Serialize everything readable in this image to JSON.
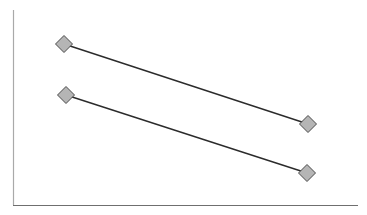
{
  "chart_data": {
    "type": "line",
    "title": "",
    "subtitle": "",
    "xlabel": "",
    "ylabel": "",
    "grid": false,
    "legend": false,
    "legend_position": "none",
    "annotations": [],
    "xtick_labels": [],
    "ytick_labels": [],
    "xlim": [
      0,
      367
    ],
    "ylim": [
      0,
      215
    ],
    "x": [
      64,
      308
    ],
    "series": [
      {
        "name": "Series 1",
        "values": [
          44,
          124
        ],
        "points": [
          {
            "x": 64,
            "y": 44
          },
          {
            "x": 308,
            "y": 124
          }
        ]
      },
      {
        "name": "Series 2",
        "values": [
          95,
          173
        ],
        "points": [
          {
            "x": 66,
            "y": 95
          },
          {
            "x": 307,
            "y": 173
          }
        ]
      }
    ]
  },
  "style": {
    "background_color": "#ffffff",
    "line_color": "#2b2b2b",
    "line_width": 1.4,
    "marker_shape": "diamond",
    "marker_fill": "#b5b5b5",
    "marker_stroke": "#4a4a4a",
    "marker_size": 17,
    "y_axis_color": "#a9a9a9",
    "x_axis_color": "#6f6f6f",
    "axis_width": 1.2
  },
  "axes": {
    "y_axis": {
      "x": 13.5,
      "y_top": 10,
      "y_bottom": 205
    },
    "x_axis": {
      "y": 205.5,
      "x_left": 13,
      "x_right": 358
    }
  },
  "accessibility": {
    "chart_description": "Line chart with two downward sloping series marked by gray diamond markers",
    "plot_area_name": "plot-area"
  }
}
